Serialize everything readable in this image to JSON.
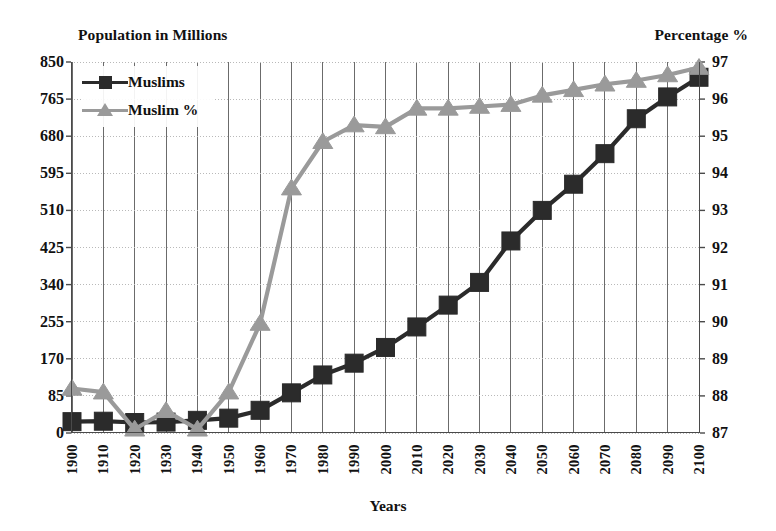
{
  "chart_data": {
    "type": "line",
    "title": "",
    "xlabel": "Years",
    "ylabel": "Population in Millions",
    "y2label": "Percentage %",
    "grid": true,
    "legend_position": "top-left",
    "x": [
      1900,
      1910,
      1920,
      1930,
      1940,
      1950,
      1960,
      1970,
      1980,
      1990,
      2000,
      2010,
      2020,
      2030,
      2040,
      2050,
      2060,
      2070,
      2080,
      2090,
      2100
    ],
    "categories": [
      "1900",
      "1910",
      "1920",
      "1930",
      "1940",
      "1950",
      "1960",
      "1970",
      "1980",
      "1990",
      "2000",
      "2010",
      "2020",
      "2030",
      "2040",
      "2050",
      "2060",
      "2070",
      "2080",
      "2090",
      "2100"
    ],
    "ylim": [
      0,
      850
    ],
    "yticks": [
      0,
      85,
      170,
      255,
      340,
      425,
      510,
      595,
      680,
      765,
      850
    ],
    "ytick_labels": [
      "0",
      "85",
      "170",
      "255",
      "340",
      "425",
      "510",
      "595",
      "680",
      "765",
      "850"
    ],
    "y2lim": [
      87,
      97
    ],
    "y2ticks": [
      87,
      88,
      89,
      90,
      91,
      92,
      93,
      94,
      95,
      96,
      97
    ],
    "y2tick_labels": [
      "87",
      "88",
      "89",
      "90",
      "91",
      "92",
      "93",
      "94",
      "95",
      "96",
      "97"
    ],
    "series": [
      {
        "name": "Muslims",
        "axis": "left",
        "marker": "square",
        "color": "#2b2b2b",
        "values": [
          26,
          27,
          24,
          25,
          29,
          34,
          52,
          92,
          133,
          160,
          196,
          243,
          293,
          345,
          440,
          510,
          570,
          640,
          720,
          770,
          815
        ]
      },
      {
        "name": "Muslim %",
        "axis": "right",
        "marker": "triangle",
        "color": "#9a9a9a",
        "values": [
          88.2,
          88.1,
          87.1,
          87.6,
          87.1,
          88.1,
          89.95,
          93.6,
          94.85,
          95.3,
          95.25,
          95.75,
          95.75,
          95.8,
          95.85,
          96.1,
          96.25,
          96.4,
          96.5,
          96.65,
          96.85
        ]
      }
    ]
  },
  "legend": {
    "items": [
      {
        "label": "Muslims",
        "color": "#2b2b2b",
        "marker": "square"
      },
      {
        "label": "Muslim %",
        "color": "#9a9a9a",
        "marker": "triangle"
      }
    ]
  },
  "axis_titles": {
    "left": "Population in Millions",
    "right": "Percentage %",
    "bottom": "Years"
  },
  "colors": {
    "series_muslims": "#2b2b2b",
    "series_percent": "#9a9a9a",
    "grid": "#6b6b6b",
    "grid_minor": "#b9b9b9",
    "axis": "#4a4a4a",
    "text": "#111111"
  }
}
